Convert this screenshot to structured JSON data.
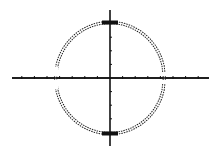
{
  "chart_data": {
    "type": "line",
    "title": "",
    "xlabel": "",
    "ylabel": "",
    "series": [
      {
        "name": "y = sqrt(16 - x^2)",
        "equation": "upper"
      },
      {
        "name": "y = -sqrt(16 - x^2)",
        "equation": "lower"
      }
    ],
    "radius": 4,
    "center": [
      0,
      0
    ],
    "xlim": [
      -8,
      8
    ],
    "ylim": [
      -5,
      5
    ],
    "x_tick_step": 1,
    "y_tick_step": 1,
    "grid": false,
    "legend": "none",
    "colors": {
      "axis": "#111111",
      "curve": "#222222",
      "background": "#ffffff"
    }
  }
}
